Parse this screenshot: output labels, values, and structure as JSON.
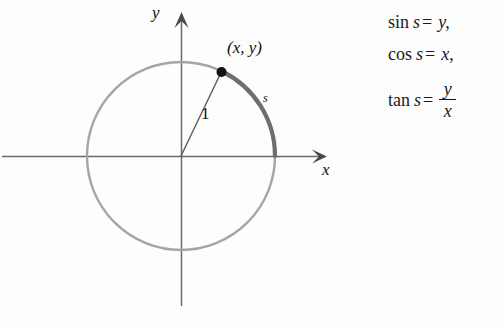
{
  "figure": {
    "axes": {
      "y_label": "y",
      "x_label": "x"
    },
    "circle": {
      "center_x": 181,
      "center_y": 156,
      "radius": 94,
      "color": "#9a9a9a",
      "stroke_width": 2.4
    },
    "arc": {
      "label": "s",
      "color": "#6b6b6b",
      "stroke_width": 4,
      "start_angle_deg": 0,
      "end_angle_deg": 64
    },
    "point": {
      "label": "(x, y)",
      "x": 222,
      "y": 72,
      "dot_color": "#111111"
    },
    "radius_segment": {
      "label": "1",
      "color": "#555555"
    }
  },
  "equations": [
    {
      "function": "sin",
      "argument": "s",
      "equals": "=",
      "result": "y,",
      "type": "simple"
    },
    {
      "function": "cos",
      "argument": "s",
      "equals": "=",
      "result": "x,",
      "type": "simple"
    },
    {
      "function": "tan",
      "argument": "s",
      "equals": "=",
      "numerator": "y",
      "denominator": "x",
      "type": "fraction"
    }
  ]
}
